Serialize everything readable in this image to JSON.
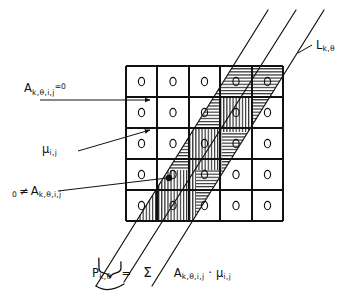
{
  "figure": {
    "background": "#ffffff",
    "ink": "#111111"
  },
  "labels": {
    "zero_attenuation": {
      "name": "A-k-theta-i-j-equals-zero",
      "base": "A",
      "subscript": "k,θ,i,j",
      "suffix": "=0",
      "text": "A k,θ,i,j =0"
    },
    "mu": {
      "name": "mu-i-j",
      "base": "μ",
      "subscript": "i,j",
      "text": "μ i,j"
    },
    "nonzero_attenuation": {
      "name": "zero-not-equal-A",
      "prefix": "0",
      "operator": "≠",
      "base": "A",
      "subscript": "k,θ,i,j",
      "text": "0 ≠ A k,θ,i,j"
    },
    "ray": {
      "name": "L-k-theta",
      "base": "L",
      "subscript": "k,θ",
      "text": "L k,θ"
    }
  },
  "formula": {
    "lhs_base": "P",
    "lhs_subscript": "k,θ",
    "equals": "=",
    "sigma": "Σ",
    "term1_base": "A",
    "term1_subscript": "k,θ,i,j",
    "multiply": "·",
    "term2_base": "μ",
    "term2_subscript": "i,j",
    "text": "P k,θ = Σ A k,θ,i,j · μ i,j"
  },
  "grid": {
    "rows": 5,
    "cols": 5,
    "left": 126,
    "top": 66,
    "cell_w": 31.4,
    "cell_h": 31.0,
    "line_color": "#111111",
    "line_width": 1.1,
    "cell_symbol": "o",
    "cell_symbol_count": 25
  },
  "band": {
    "name": "ray-band",
    "line_color": "#111111",
    "line_width": 1.2,
    "lines": [
      {
        "id": "band-left-edge",
        "x1": 96,
        "y1": 286,
        "x2": 268,
        "y2": 10
      },
      {
        "id": "band-center",
        "x1": 124,
        "y1": 286,
        "x2": 296,
        "y2": 10
      },
      {
        "id": "band-right-edge",
        "x1": 152,
        "y1": 286,
        "x2": 324,
        "y2": 10
      }
    ],
    "hatch_color": "#111111",
    "hatched_cells": [
      {
        "row": 1,
        "col": 3
      },
      {
        "row": 1,
        "col": 4
      },
      {
        "row": 2,
        "col": 2
      },
      {
        "row": 2,
        "col": 3
      },
      {
        "row": 3,
        "col": 1
      },
      {
        "row": 3,
        "col": 2
      },
      {
        "row": 4,
        "col": 1
      }
    ]
  },
  "markers": {
    "nonzero_dot": {
      "cx": 169,
      "cy": 178,
      "r": 3.2,
      "color": "#111111"
    },
    "brace_label": "end-of-ray-brace"
  },
  "leaders": [
    {
      "name": "leader-a-zero",
      "x1": 40,
      "y1": 100,
      "x2": 152,
      "y2": 100,
      "arrow": true
    },
    {
      "name": "leader-mu",
      "x1": 76,
      "y1": 150,
      "x2": 152,
      "y2": 131,
      "arrow": true
    },
    {
      "name": "leader-a-nonzero",
      "x1": 60,
      "y1": 190,
      "x2": 168,
      "y2": 178,
      "arrow": false
    },
    {
      "name": "leader-ray-label",
      "x1": 296,
      "y1": 52,
      "x2": 314,
      "y2": 44,
      "arrow": false
    }
  ]
}
